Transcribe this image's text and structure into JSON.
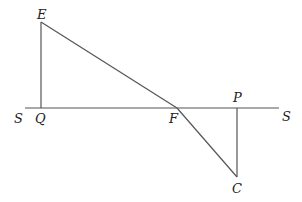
{
  "diagram": {
    "labels": {
      "E": "E",
      "Q": "Q",
      "F": "F",
      "P": "P",
      "C": "C",
      "S_left": "S",
      "S_right": "S"
    },
    "points": {
      "E": [
        41,
        22
      ],
      "Q": [
        41,
        108
      ],
      "F": [
        177,
        108
      ],
      "P": [
        237,
        108
      ],
      "C": [
        237,
        177
      ]
    },
    "segments": [
      [
        "S_left",
        "S_right"
      ],
      [
        "E",
        "Q"
      ],
      [
        "E",
        "F"
      ],
      [
        "F",
        "C"
      ],
      [
        "P",
        "C"
      ]
    ],
    "line_color": "#555555"
  }
}
